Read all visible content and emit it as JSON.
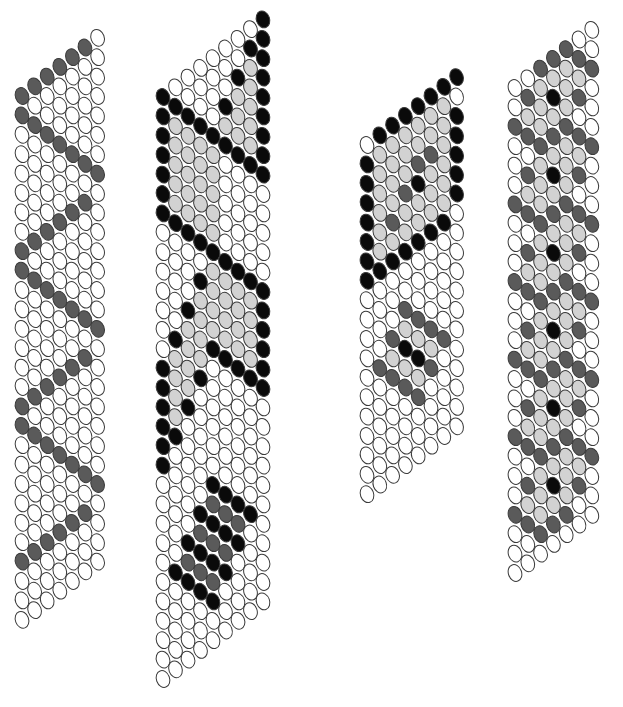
{
  "diagram": {
    "title": "",
    "legend": {
      "o": "white bead",
      "g": "light gray bead",
      "d": "dark gray bead",
      "k": "black bead"
    },
    "colors": {
      "o": "#ffffff",
      "g": "#d2d2d2",
      "d": "#5a5a5a",
      "k": "#0a0a0a",
      "outline": "#3a3a3a"
    },
    "bead": {
      "rx": 6.6,
      "ry": 8.6,
      "tilt": -20
    },
    "strips": [
      {
        "name": "zigzag-strip",
        "x0": 22,
        "y0": 96,
        "dx": 12.6,
        "dy": 19.4,
        "shift": 9.7,
        "cols": 7,
        "rows": [
          "dddddd",
          "d......",
          ".d.....",
          "..d....",
          "...d...",
          "....d..",
          ".....d.",
          "......d",
          "dddddd.",
          "d......",
          ".d.....",
          "..d....",
          "...d...",
          "....d..",
          ".....d.",
          "......d",
          "dddddd.",
          "d......",
          ".d.....",
          "..d....",
          "...d...",
          "....d..",
          ".....d.",
          "......d",
          "dddddd.",
          ".......",
          ".......",
          "......."
        ]
      },
      {
        "name": "cross-diamond-strip",
        "x0": 163,
        "y0": 97,
        "dx": 12.5,
        "dy": 19.4,
        "shift": 9.7,
        "cols": 9,
        "rows": [
          "k.......k",
          "kk.....kk",
          "kgk...kgk",
          "kggk.kggk",
          "kgggkgggk",
          "kggggkggk",
          "kgggg.kgk",
          ".kggg..kk",
          "..kgg...k",
          "...kg....",
          "....k....",
          "...kgk...",
          "..kgggk..",
          ".kgggggk.",
          "kgggggggk",
          "kgggkgggk",
          "kggk.kggk",
          "kgk...kgk",
          "kk.....kk",
          "k.......k",
          ".........",
          ".........",
          "....k....",
          "...kdk...",
          "..kdkdk..",
          ".kdkdkdk.",
          "..kdkdk..",
          "...kdk...",
          "....k....",
          ".........",
          "........."
        ]
      },
      {
        "name": "parallelogram-strip",
        "x0": 367,
        "y0": 145,
        "dx": 12.8,
        "dy": 19.4,
        "shift": 9.7,
        "cols": 8,
        "rows": [
          ".kkkkkkk",
          "kgggggg.",
          "kggggggk",
          "kgggddgk",
          "kggdkggk",
          "kgdggggk",
          "kggggggk",
          "kkkkkkk.",
          "........",
          "........",
          "...d....",
          "..dgd...",
          ".dgkgd..",
          "..dgkgd.",
          "...dgd..",
          "....d...",
          "........",
          "........",
          "........"
        ]
      },
      {
        "name": "diamond-chain-strip",
        "x0": 515,
        "y0": 88,
        "dx": 12.8,
        "dy": 19.4,
        "shift": 9.7,
        "cols": 7,
        "rows": [
          "..ddd..",
          ".dgggd.",
          "dggkggd",
          ".dgggd.",
          "..ddd..",
          ".dgggd.",
          "dggkggd",
          ".dgggd.",
          "..ddd..",
          ".dgggd.",
          "dggkggd",
          ".dgggd.",
          "..ddd..",
          ".dgggd.",
          "dggkggd",
          ".dgggd.",
          "..ddd..",
          ".dgggd.",
          "dggkggd",
          ".dgggd.",
          "..ddd..",
          ".dgggd.",
          "dggkggd",
          ".dgggd.",
          "..ddd..",
          "......."
        ]
      }
    ]
  }
}
